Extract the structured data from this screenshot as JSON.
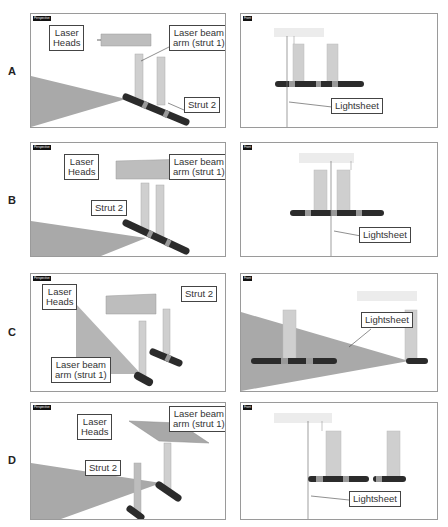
{
  "rows": [
    {
      "label": "A",
      "left_view": "Perspective",
      "right_view": "Front",
      "left_callouts": [
        "Laser Heads",
        "Laser beam arm (strut 1)",
        "Strut 2"
      ],
      "right_callouts": [
        "Lightsheet"
      ]
    },
    {
      "label": "B",
      "left_view": "Perspective",
      "right_view": "Front",
      "left_callouts": [
        "Laser Heads",
        "Laser beam arm (strut 1)",
        "Strut 2"
      ],
      "right_callouts": [
        "Lightsheet"
      ]
    },
    {
      "label": "C",
      "left_view": "Perspective",
      "right_view": "Front",
      "left_callouts": [
        "Laser Heads",
        "Strut 2",
        "Laser beam arm (strut 1)"
      ],
      "right_callouts": [
        "Lightsheet"
      ]
    },
    {
      "label": "D",
      "left_view": "Perspective",
      "right_view": "Front",
      "left_callouts": [
        "Laser Heads",
        "Laser beam arm (strut 1)",
        "Strut 2"
      ],
      "right_callouts": [
        "Lightsheet"
      ]
    }
  ],
  "labels": {
    "laser_heads_1": "Laser",
    "laser_heads_2": "Heads",
    "arm_1": "Laser beam",
    "arm_2": "arm (strut 1)",
    "strut2": "Strut 2",
    "lightsheet": "Lightsheet"
  },
  "colors": {
    "sheet": "#a9a9a9",
    "strut": "#c9c9c9",
    "bar": "#2b2b2b",
    "band": "#9a9a9a"
  }
}
